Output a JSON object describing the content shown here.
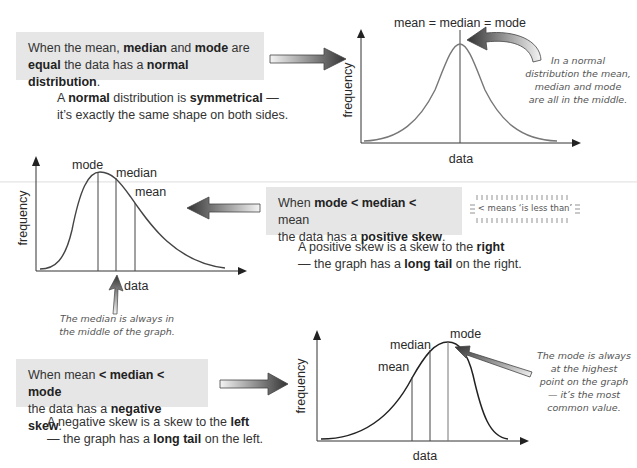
{
  "top_edge_text": "",
  "section_normal": {
    "box": {
      "line1_parts": [
        "When the ",
        "mean",
        ", ",
        "median",
        " and ",
        "mode",
        " are"
      ],
      "line2_parts": [
        "equal",
        " the data has a ",
        "normal distribution",
        "."
      ]
    },
    "para": {
      "line1_parts": [
        "A ",
        "normal",
        " distribution is ",
        "symmetrical",
        " —"
      ],
      "line2": "it’s exactly the same shape on both sides."
    },
    "graph": {
      "top_label": "mean = median = mode",
      "y_label": "frequency",
      "x_label": "data"
    },
    "note": [
      "In a normal",
      "distribution the mean,",
      "median and mode",
      "are all in the middle."
    ]
  },
  "section_positive": {
    "box": {
      "line1_parts": [
        "When ",
        "mode < median <",
        " mean"
      ],
      "line2_parts": [
        "the data has a ",
        "positive skew",
        "."
      ]
    },
    "less_than_note": "< means ‘is less than’",
    "para": {
      "line1_parts": [
        "A positive skew is a skew to the ",
        "right"
      ],
      "line2_parts": [
        "— the graph has a ",
        "long tail",
        " on the right."
      ]
    },
    "graph": {
      "labels": {
        "mode": "mode",
        "median": "median",
        "mean": "mean"
      },
      "y_label": "frequency",
      "x_label": "data"
    },
    "note": [
      "The median is always in",
      "the middle of the graph."
    ]
  },
  "section_negative": {
    "box": {
      "line1_parts": [
        "When ",
        "mean",
        " < ",
        "median",
        " < ",
        "mode"
      ],
      "line2_parts": [
        "the data has a ",
        "negative skew",
        "."
      ]
    },
    "para": {
      "line1_parts": [
        "A negative skew is a skew to the ",
        "left"
      ],
      "line2_parts": [
        "— the graph has a ",
        "long tail",
        " on the left."
      ]
    },
    "graph": {
      "labels": {
        "mean": "mean",
        "median": "median",
        "mode": "mode"
      },
      "y_label": "frequency",
      "x_label": "data"
    },
    "note": [
      "The mode is always",
      "at the highest",
      "point on the graph",
      "— it’s the most",
      "common value."
    ]
  },
  "colors": {
    "box_bg": "#e6e6e6",
    "curve": "#555555",
    "arrow_dark": "#333333"
  }
}
